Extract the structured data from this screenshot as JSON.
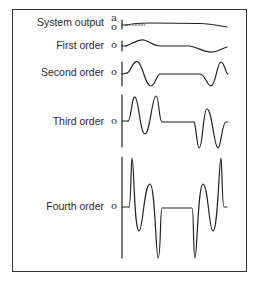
{
  "figure": {
    "rows": [
      {
        "label": "System output",
        "axis_marks": [
          "a",
          "o"
        ],
        "baseline_y": 25
      },
      {
        "label": "First order",
        "axis_marks": [
          "o"
        ],
        "baseline_y": 46
      },
      {
        "label": "Second order",
        "axis_marks": [
          "o"
        ],
        "baseline_y": 73
      },
      {
        "label": "Third order",
        "axis_marks": [
          "o"
        ],
        "baseline_y": 122
      },
      {
        "label": "Fourth order",
        "axis_marks": [
          "o"
        ],
        "baseline_y": 207
      }
    ],
    "colors": {
      "line": "#222222",
      "frame": "#333333",
      "text": "#2a2a2a"
    }
  }
}
